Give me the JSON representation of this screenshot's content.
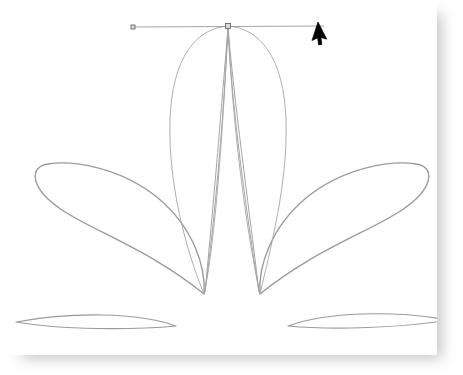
{
  "app": {
    "title": "Vector Drawing Canvas",
    "document_name": "untitled path drawing"
  },
  "canvas": {
    "width": 437,
    "height": 355,
    "background_color": "#ffffff",
    "page_background_color": "#ffffff",
    "shadow_color": "#9a9a9a",
    "shadow_offset_x": 22,
    "shadow_offset_y": 14
  },
  "style": {
    "stroke_color": "#9b9b9b",
    "stroke_color_thin": "#a5a5a5",
    "guide_color": "#8e8e8e",
    "node_fill": "#d9d9d9",
    "node_stroke": "#5a5a5a",
    "cursor_color": "#000000",
    "stroke_width_outer": 1.4,
    "stroke_width_inner": 0.8,
    "stroke_width_guide": 0.7
  },
  "artwork": {
    "description": "Five-petal fan of open bezier teardrop curves converging on two base nodes",
    "anchor_points": [
      {
        "name": "top-apex",
        "x": 228,
        "y": 26
      },
      {
        "name": "base-left",
        "x": 204,
        "y": 294
      },
      {
        "name": "base-right",
        "x": 260,
        "y": 294
      }
    ],
    "petals": [
      {
        "name": "petal-outer-left",
        "stroke_width": 1.4,
        "path": "M 204 294 C 150 250 95 232 62 210 C 28 187 30 166 48 164 C 72 160 120 167 158 198 C 194 228 206 268 204 294 Z"
      },
      {
        "name": "petal-outer-right",
        "stroke_width": 1.4,
        "path": "M 260 294 C 314 250 369 232 402 210 C 436 187 434 166 416 164 C 392 160 344 167 306 198 C 270 228 258 268 260 294 Z"
      },
      {
        "name": "petal-center-outer",
        "stroke_width": 0.9,
        "path": "M 228 26 C 196 28 172 58 170 120 C 168 184 186 250 204 294 C 214 248 222 150 228 26 Z"
      },
      {
        "name": "petal-center-outer-right",
        "stroke_width": 0.9,
        "path": "M 228 26 C 260 28 284 58 286 120 C 288 184 270 250 260 294 C 250 248 234 150 228 26 Z"
      },
      {
        "name": "petal-inner-left",
        "stroke_width": 1.0,
        "path": "M 228 28 C 222 100 214 200 205 292 C 216 210 224 110 228 28 Z"
      },
      {
        "name": "petal-inner-right",
        "stroke_width": 1.0,
        "path": "M 228 28 C 234 100 248 200 259 292 C 246 210 232 110 228 28 Z"
      },
      {
        "name": "leaf-sliver-left",
        "stroke_width": 1.2,
        "path": "M 16 322 C 70 312 138 312 176 326 C 132 330 62 330 16 322 Z"
      },
      {
        "name": "leaf-sliver-right",
        "stroke_width": 1.2,
        "path": "M 448 320 C 394 310 326 312 288 326 C 332 330 402 328 448 320 Z"
      }
    ]
  },
  "selection": {
    "handle_line": {
      "name": "control-handle-line",
      "x1": 133,
      "y1": 27,
      "x2": 324,
      "y2": 26,
      "color": "#8e8e8e"
    },
    "nodes": [
      {
        "name": "handle-node-left",
        "x": 133,
        "y": 27,
        "size": 4
      },
      {
        "name": "anchor-node-center",
        "x": 228,
        "y": 26,
        "size": 5
      }
    ]
  },
  "cursor": {
    "name": "arrow-pointer",
    "x": 318,
    "y": 22,
    "rotation_deg": 18,
    "color": "#000000"
  }
}
